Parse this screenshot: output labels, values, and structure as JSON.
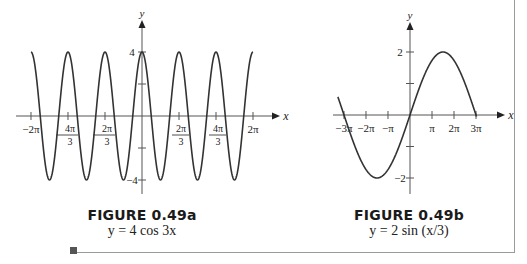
{
  "chart_data": [
    {
      "type": "line",
      "title": "FIGURE 0.49a",
      "subtitle": "y = 4 cos 3x",
      "function": "4*cos(3*x)",
      "xlabel": "x",
      "ylabel": "y",
      "xlim": [
        -6.2832,
        6.2832
      ],
      "ylim": [
        -4,
        4
      ],
      "x_ticks": [
        -6.2832,
        -4.1888,
        -2.0944,
        2.0944,
        4.1888,
        6.2832
      ],
      "x_tick_labels": [
        "-2π",
        "-4π/3",
        "-2π/3",
        "2π/3",
        "4π/3",
        "2π"
      ],
      "y_ticks": [
        -4,
        -2,
        2,
        4
      ],
      "y_tick_labels": [
        "-4",
        "",
        "",
        "4"
      ],
      "grid": false,
      "legend": null,
      "series": [
        {
          "name": "y = 4 cos 3x",
          "x_range": [
            -6.2832,
            6.2832
          ],
          "amplitude": 4,
          "period": 2.0944
        }
      ]
    },
    {
      "type": "line",
      "title": "FIGURE 0.49b",
      "subtitle": "y = 2 sin (x/3)",
      "function": "2*sin(x/3)",
      "xlabel": "x",
      "ylabel": "y",
      "xlim": [
        -9.4248,
        9.4248
      ],
      "ylim": [
        -2,
        2
      ],
      "x_ticks": [
        -9.4248,
        -6.2832,
        -3.1416,
        3.1416,
        6.2832,
        9.4248
      ],
      "x_tick_labels": [
        "-3π",
        "-2π",
        "-π",
        "π",
        "2π",
        "3π"
      ],
      "y_ticks": [
        -2,
        -1,
        1,
        2
      ],
      "y_tick_labels": [
        "-2",
        "",
        "",
        "2"
      ],
      "grid": false,
      "legend": null,
      "series": [
        {
          "name": "y = 2 sin(x/3)",
          "x_range": [
            -10.3,
            9.5
          ],
          "amplitude": 2,
          "period": 18.8496
        }
      ]
    }
  ],
  "figures": {
    "a": {
      "label": "FIGURE 0.49a",
      "equation": "y = 4 cos 3x"
    },
    "b": {
      "label": "FIGURE 0.49b",
      "equation": "y = 2 sin (x/3)"
    }
  },
  "axes": {
    "x_label": "x",
    "y_label": "y"
  },
  "colors": {
    "curve": "#333333",
    "axis": "#555555",
    "border": "#9a9a9a"
  }
}
